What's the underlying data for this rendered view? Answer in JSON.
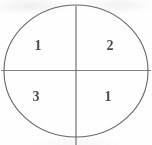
{
  "figure": {
    "type": "circle-quadrant-diagram",
    "clipped_caption": "......................",
    "circle": {
      "center_x": 76,
      "center_y": 71,
      "radius_x": 72,
      "radius_y": 66,
      "stroke_color": "#555555",
      "stroke_width": 1,
      "fill": "none"
    },
    "vertical_divider": {
      "x": 76,
      "y_start": 6,
      "y_end": 145,
      "stroke_color": "#555555"
    },
    "horizontal_divider": {
      "y": 70,
      "x_start": 1,
      "x_end": 151,
      "stroke_color": "#6b6b6b"
    },
    "quadrants": [
      {
        "position": "upper-left",
        "label": "1"
      },
      {
        "position": "upper-right",
        "label": "2"
      },
      {
        "position": "lower-left",
        "label": "3"
      },
      {
        "position": "lower-right",
        "label": "1"
      }
    ],
    "background_color": "#fefefe",
    "label_color": "#3d3d3d"
  }
}
